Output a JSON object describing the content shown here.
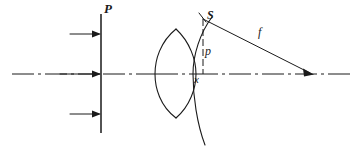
{
  "figure": {
    "type": "optics-ray-diagram",
    "title": "",
    "background_color": "#ffffff",
    "line_color": "#1a1a1a",
    "width": 360,
    "height": 153
  },
  "labels": {
    "plane": "P",
    "sphere_point": "S",
    "focal_length": "f",
    "ray_height": "p",
    "axis_offset": "x"
  },
  "elements": {
    "incident_rays_count": 3,
    "lens_name": "biconvex-lens",
    "reference_sphere_name": "reference-sphere-arc",
    "optical_axis_name": "optical-axis",
    "focal_point_name": "focal-point"
  },
  "geometry": {
    "optical_axis_y": 74,
    "plane_x": 101,
    "plane_top_y": 14,
    "plane_bottom_y": 133,
    "incident_ray_ys": [
      34,
      74,
      114
    ],
    "incident_ray_start_x": 70,
    "axis_start_x": 12,
    "axis_end_x": 350,
    "lens_left_x": 155,
    "lens_right_x": 196,
    "lens_top_vertex": [
      176,
      29
    ],
    "lens_bottom_vertex": [
      176,
      118
    ],
    "sphere_vertex_x": 193,
    "sphere_top": [
      212,
      17
    ],
    "sphere_bottom": [
      205,
      145
    ],
    "point_S": [
      203,
      18
    ],
    "focal_point": [
      313,
      74
    ]
  }
}
